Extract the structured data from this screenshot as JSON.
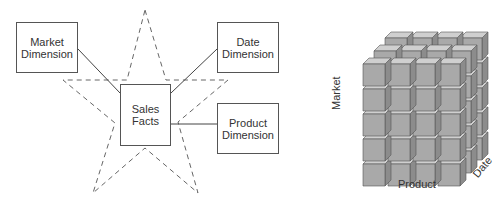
{
  "star_schema": {
    "fact": {
      "line1": "Sales",
      "line2": "Facts"
    },
    "dimensions": [
      {
        "line1": "Market",
        "line2": "Dimension"
      },
      {
        "line1": "Date",
        "line2": "Dimension"
      },
      {
        "line1": "Product",
        "line2": "Dimension"
      }
    ]
  },
  "cube": {
    "axes": {
      "x": "Product",
      "y": "Market",
      "z": "Date"
    },
    "columns": 4,
    "rows": 5,
    "depth": 3
  },
  "colors": {
    "line": "#444444",
    "star_dash": "#666666",
    "cube_front": "#a9a9a9",
    "cube_top": "#cfcfcf",
    "cube_side": "#8c8c8c",
    "cube_edge": "#555555"
  }
}
